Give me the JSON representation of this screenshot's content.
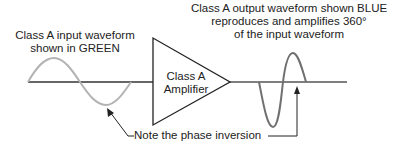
{
  "diagram": {
    "input_label": {
      "line1": "Class A input waveform",
      "line2": "shown in GREEN"
    },
    "output_label": {
      "line1": "Class A output waveform shown BLUE",
      "line2": "reproduces and amplifies 360°",
      "line3": "of the input waveform"
    },
    "amplifier_label": {
      "line1": "Class A",
      "line2": "Amplifier"
    },
    "note_label": "Note the phase inversion",
    "colors": {
      "input_wave": "#b3b3b3",
      "output_wave": "#707070",
      "line": "#333333",
      "text": "#222222"
    }
  }
}
